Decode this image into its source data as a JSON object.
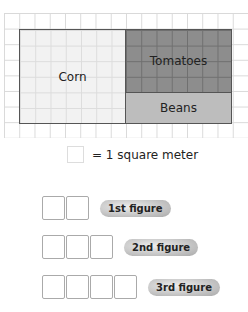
{
  "garden": {
    "regions": [
      {
        "label": "Corn",
        "color": "#f2f2f2"
      },
      {
        "label": "Tomatoes",
        "color": "#8d8d8d"
      },
      {
        "label": "Beans",
        "color": "#bdbdbd"
      }
    ],
    "grid": {
      "columns": 16,
      "rows": 8
    }
  },
  "legend": {
    "text": "= 1 square meter"
  },
  "figures": [
    {
      "label": "1st figure",
      "squares": 2
    },
    {
      "label": "2nd figure",
      "squares": 3
    },
    {
      "label": "3rd figure",
      "squares": 4
    }
  ]
}
